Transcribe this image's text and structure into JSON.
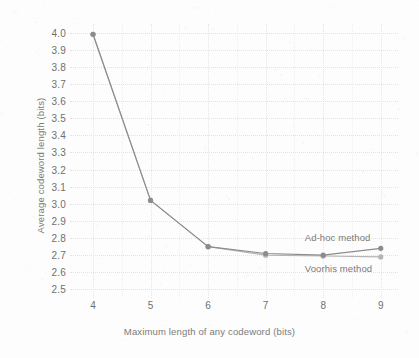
{
  "chart_data": {
    "type": "line",
    "title": "",
    "xlabel": "Maximum length of any codeword (bits)",
    "ylabel": "Average  codeword length (bits)",
    "x": [
      4,
      5,
      6,
      7,
      8,
      9
    ],
    "xlim": [
      3.6,
      9.3
    ],
    "ylim": [
      2.45,
      4.05
    ],
    "xticks": [
      "4",
      "5",
      "6",
      "7",
      "8",
      "9"
    ],
    "yticks": [
      "4.0",
      "3.9",
      "3.8",
      "3.7",
      "3.6",
      "3.5",
      "3.4",
      "3.3",
      "3.2",
      "3.1",
      "3.0",
      "2.9",
      "2.8",
      "2.7",
      "2.6",
      "2.5"
    ],
    "ytick_values": [
      4.0,
      3.9,
      3.8,
      3.7,
      3.6,
      3.5,
      3.4,
      3.3,
      3.2,
      3.1,
      3.0,
      2.9,
      2.8,
      2.7,
      2.6,
      2.5
    ],
    "grid": true,
    "grid_style": "dotted",
    "legend_position": "inline-right",
    "series": [
      {
        "name": "Ad-hoc method",
        "values": [
          3.99,
          3.02,
          2.75,
          2.71,
          2.7,
          2.74
        ],
        "color": "#8c8c8c",
        "marker": "circle",
        "label_x": 9,
        "label_y": 2.8
      },
      {
        "name": "Voorhis method",
        "values": [
          3.99,
          3.02,
          2.75,
          2.7,
          2.695,
          2.69
        ],
        "color": "#b4b4b4",
        "marker": "circle",
        "label_x": 9,
        "label_y": 2.62
      }
    ],
    "annotations": [
      {
        "text": "Ad-hoc method"
      },
      {
        "text": "Voorhis method"
      }
    ]
  },
  "colors": {
    "background": "#fdfdfd",
    "axis_text": "#6f6f6f",
    "label_text": "#7b7b7b",
    "grid": "#e3e3e3",
    "series_primary": "#8c8c8c",
    "series_secondary": "#b4b4b4"
  }
}
